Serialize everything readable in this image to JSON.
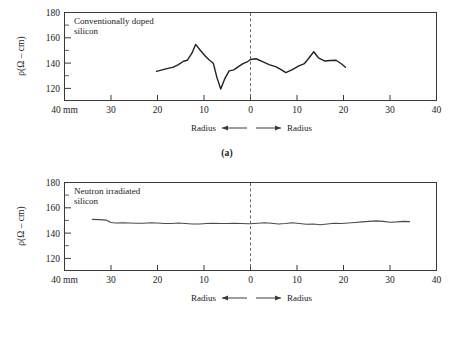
{
  "figure": {
    "panels": [
      {
        "id": "a",
        "caption": "(a)",
        "plot_label_line1": "Conventionally doped",
        "plot_label_line2": "silicon",
        "ylabel": "ρ(Ω – cm)",
        "xaxis_unit_label": "40 mm",
        "radius_left_label": "Radius",
        "radius_right_label": "Radius",
        "ytick_labels": [
          "180",
          "160",
          "140",
          "120"
        ],
        "xtick_labels": [
          "40 mm",
          "30",
          "20",
          "10",
          "0",
          "10",
          "20",
          "30",
          "40"
        ]
      },
      {
        "id": "b",
        "caption": "(b)",
        "plot_label_line1": "Neutron irradiated",
        "plot_label_line2": "silicon",
        "ylabel": "ρ(Ω – cm)",
        "xaxis_unit_label": "40 mm",
        "radius_left_label": "Radius",
        "radius_right_label": "Radius",
        "ytick_labels": [
          "180",
          "160",
          "140",
          "120"
        ],
        "xtick_labels": [
          "40 mm",
          "30",
          "20",
          "10",
          "0",
          "10",
          "20",
          "30",
          "40"
        ]
      }
    ]
  },
  "chart_data": [
    {
      "type": "line",
      "title": "Conventionally doped silicon",
      "panel": "(a)",
      "xlabel": "Radius (mm)",
      "ylabel": "ρ(Ω – cm)",
      "xlim": [
        -40,
        40
      ],
      "ylim": [
        110,
        180
      ],
      "yticks": [
        120,
        140,
        160,
        180
      ],
      "xticks": [
        -40,
        -30,
        -20,
        -10,
        0,
        10,
        20,
        30,
        40
      ],
      "xtick_labels": [
        "40 mm",
        "30",
        "20",
        "10",
        "0",
        "10",
        "20",
        "30",
        "40"
      ],
      "grid": false,
      "legend": false,
      "annotations": [
        "Conventionally doped silicon",
        "Radius ←",
        "→ Radius",
        "dashed vertical line at x = 0"
      ],
      "x": [
        -20.2,
        -18.4,
        -16.6,
        -15.6,
        -14.4,
        -13.6,
        -12.6,
        -11.8,
        -10.8,
        -9.8,
        -8.8,
        -8.0,
        -7.2,
        -6.4,
        -5.6,
        -4.6,
        -3.6,
        -2.6,
        -1.6,
        -0.6,
        0.0,
        1.2,
        2.6,
        4.0,
        5.4,
        6.4,
        7.6,
        9.0,
        10.4,
        11.6,
        12.4,
        13.6,
        14.6,
        16.0,
        17.2,
        18.4,
        19.6,
        20.4
      ],
      "y": [
        133.2,
        135.0,
        136.6,
        138.4,
        141.2,
        142.0,
        147.6,
        154.6,
        150.0,
        145.6,
        142.0,
        139.6,
        128.0,
        119.2,
        126.8,
        133.6,
        134.4,
        137.0,
        139.4,
        141.0,
        142.6,
        143.2,
        141.0,
        138.6,
        137.0,
        135.0,
        132.2,
        134.6,
        137.6,
        139.4,
        143.0,
        148.8,
        144.0,
        141.4,
        141.8,
        142.0,
        139.0,
        136.4,
        131.0
      ]
    },
    {
      "type": "line",
      "title": "Neutron irradiated silicon",
      "panel": "(b)",
      "xlabel": "Radius (mm)",
      "ylabel": "ρ(Ω – cm)",
      "xlim": [
        -40,
        40
      ],
      "ylim": [
        110,
        180
      ],
      "yticks": [
        120,
        140,
        160,
        180
      ],
      "xticks": [
        -40,
        -30,
        -20,
        -10,
        0,
        10,
        20,
        30,
        40
      ],
      "xtick_labels": [
        "40 mm",
        "30",
        "20",
        "10",
        "0",
        "10",
        "20",
        "30",
        "40"
      ],
      "grid": false,
      "legend": false,
      "annotations": [
        "Neutron irradiated silicon",
        "Radius ←",
        "→ Radius",
        "dashed vertical line at x = 0"
      ],
      "x": [
        -34.0,
        -32.5,
        -31.0,
        -30.0,
        -29.0,
        -27.5,
        -26.0,
        -24.5,
        -23.0,
        -21.5,
        -20.0,
        -18.5,
        -17.0,
        -15.5,
        -14.0,
        -12.5,
        -11.0,
        -9.5,
        -8.0,
        -6.5,
        -5.0,
        -3.5,
        -2.0,
        -0.5,
        0.0,
        1.5,
        3.0,
        4.5,
        6.0,
        7.5,
        9.0,
        10.5,
        12.0,
        13.5,
        15.0,
        16.5,
        18.0,
        19.5,
        21.0,
        22.5,
        24.0,
        25.5,
        27.0,
        28.5,
        30.0,
        31.5,
        33.0,
        34.2
      ],
      "y": [
        150.6,
        150.4,
        150.0,
        148.2,
        147.8,
        148.0,
        147.8,
        147.6,
        147.6,
        148.0,
        147.8,
        147.4,
        147.4,
        147.8,
        147.4,
        147.0,
        147.0,
        147.4,
        147.6,
        147.4,
        147.4,
        147.6,
        147.4,
        147.2,
        147.2,
        147.6,
        148.0,
        147.6,
        147.0,
        147.4,
        148.0,
        147.4,
        146.8,
        147.0,
        146.4,
        147.0,
        147.6,
        147.4,
        147.8,
        148.2,
        148.6,
        149.0,
        149.4,
        149.0,
        148.4,
        148.6,
        149.0,
        148.8
      ]
    }
  ]
}
